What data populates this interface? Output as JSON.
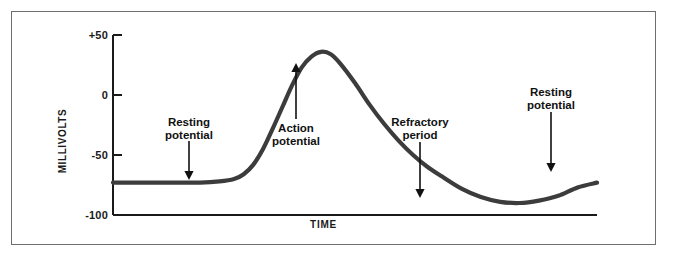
{
  "figure": {
    "background_color": "#ffffff",
    "frame_color": "#6e6e6e",
    "curve_color": "#3c3c3c",
    "axis_color": "#1a1a1a"
  },
  "chart_data": {
    "type": "line",
    "title": "",
    "xlabel": "TIME",
    "ylabel": "MILLIVOLTS",
    "ylim": [
      -100,
      50
    ],
    "yticks": [
      50,
      0,
      -50,
      -100
    ],
    "ytick_labels": [
      "+50",
      "0",
      "-50",
      "-100"
    ],
    "xlim": [
      0,
      100
    ],
    "xticks": [],
    "xtick_labels": [],
    "grid": false,
    "legend": "none",
    "series": [
      {
        "name": "Membrane potential",
        "x": [
          0,
          6,
          12,
          18,
          22,
          25,
          27,
          29,
          31,
          33,
          35,
          37,
          39,
          41,
          43,
          45,
          47,
          50,
          53,
          56,
          59,
          62,
          65,
          68,
          72,
          76,
          80,
          84,
          88,
          92,
          96,
          100
        ],
        "values": [
          -73,
          -73,
          -73,
          -73,
          -72,
          -70,
          -66,
          -58,
          -45,
          -28,
          -10,
          8,
          23,
          32,
          36,
          34,
          26,
          10,
          -8,
          -24,
          -38,
          -50,
          -60,
          -68,
          -78,
          -85,
          -89,
          -90,
          -88,
          -84,
          -77,
          -73
        ]
      }
    ],
    "annotations": [
      {
        "id": "resting-potential-left",
        "label_line1": "Resting",
        "label_line2": "potential",
        "arrow": "down",
        "label_x": 189,
        "label_y": 116,
        "arrow_x": 189,
        "arrow_y_start": 141,
        "arrow_y_end": 180
      },
      {
        "id": "action-potential",
        "label_line1": "Action",
        "label_line2": "potential",
        "arrow": "up",
        "label_x": 296,
        "label_y": 122,
        "arrow_x": 296,
        "arrow_y_start": 119,
        "arrow_y_end": 63
      },
      {
        "id": "refractory-period",
        "label_line1": "Refractory",
        "label_line2": "period",
        "arrow": "down",
        "label_x": 420,
        "label_y": 116,
        "arrow_x": 420,
        "arrow_y_start": 142,
        "arrow_y_end": 198
      },
      {
        "id": "resting-potential-right",
        "label_line1": "Resting",
        "label_line2": "potential",
        "arrow": "down",
        "label_x": 551,
        "label_y": 86,
        "arrow_x": 551,
        "arrow_y_start": 112,
        "arrow_y_end": 172
      }
    ]
  },
  "axis": {
    "y_title": "MILLIVOLTS",
    "x_title": "TIME",
    "tick_50": "+50",
    "tick_0": "0",
    "tick_neg50": "-50",
    "tick_neg100": "-100"
  }
}
